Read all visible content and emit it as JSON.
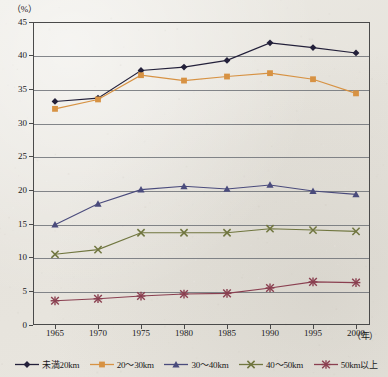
{
  "chart_data": {
    "type": "line",
    "title": "",
    "xlabel": "年",
    "ylabel": "%",
    "ylim": [
      0,
      45
    ],
    "ytick_step": 5,
    "grid": true,
    "legend_position": "bottom",
    "categories": [
      "1965",
      "1970",
      "1975",
      "1980",
      "1985",
      "1990",
      "1995",
      "2000"
    ],
    "yticks": [
      "0",
      "5",
      "10",
      "15",
      "20",
      "25",
      "30",
      "35",
      "40",
      "45"
    ],
    "series": [
      {
        "name": "未満20km",
        "color": "#23203a",
        "marker": "diamond",
        "values": [
          33.2,
          33.7,
          37.8,
          38.3,
          39.3,
          41.9,
          41.2,
          40.4
        ]
      },
      {
        "name": "20～30km",
        "color": "#d79243",
        "marker": "square",
        "values": [
          32.1,
          33.5,
          37.1,
          36.3,
          36.9,
          37.4,
          36.5,
          34.4
        ]
      },
      {
        "name": "30～40km",
        "color": "#4a4b7c",
        "marker": "triangle",
        "values": [
          14.9,
          18.0,
          20.1,
          20.6,
          20.2,
          20.8,
          19.9,
          19.4
        ]
      },
      {
        "name": "40～50km",
        "color": "#70763f",
        "marker": "cross",
        "values": [
          10.5,
          11.2,
          13.7,
          13.7,
          13.7,
          14.3,
          14.1,
          13.9
        ]
      },
      {
        "name": "50km以上",
        "color": "#8a3f50",
        "marker": "asterisk",
        "values": [
          3.6,
          3.9,
          4.3,
          4.6,
          4.7,
          5.5,
          6.4,
          6.3
        ]
      }
    ]
  },
  "axes": {
    "y_unit_label": "（%）",
    "x_unit_label": "（年）"
  },
  "legend": {
    "items": [
      {
        "label": "未満20km"
      },
      {
        "label": "20～30km"
      },
      {
        "label": "30～40km"
      },
      {
        "label": "40～50km"
      },
      {
        "label": "50km以上"
      }
    ]
  }
}
